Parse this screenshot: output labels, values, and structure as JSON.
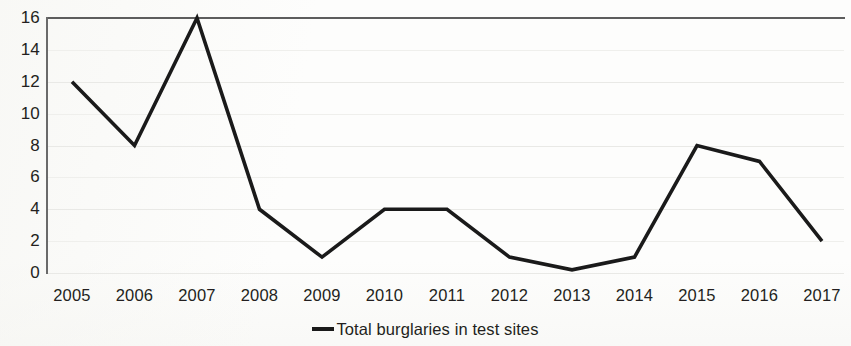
{
  "chart_data": {
    "type": "line",
    "title": "",
    "subtitle": "",
    "xlabel": "",
    "ylabel": "",
    "x": [
      "2005",
      "2006",
      "2007",
      "2008",
      "2009",
      "2010",
      "2011",
      "2012",
      "2013",
      "2014",
      "2015",
      "2016",
      "2017"
    ],
    "categories": [
      "2005",
      "2006",
      "2007",
      "2008",
      "2009",
      "2010",
      "2011",
      "2012",
      "2013",
      "2014",
      "2015",
      "2016",
      "2017"
    ],
    "series": [
      {
        "name": "Total burglaries in test sites",
        "values": [
          12,
          8,
          16,
          4,
          1,
          4,
          4,
          1,
          0.2,
          1,
          8,
          7,
          2
        ],
        "color": "#1a1a1a"
      }
    ],
    "ylim": [
      0,
      16
    ],
    "yticks": [
      0,
      2,
      4,
      6,
      8,
      10,
      12,
      14,
      16
    ],
    "ytick_labels": [
      "0",
      "2",
      "4",
      "6",
      "8",
      "10",
      "12",
      "14",
      "16"
    ],
    "grid": true,
    "grid_axis": "y",
    "legend": {
      "position": "bottom-center",
      "entries": [
        {
          "label": "Total burglaries in test sites",
          "marker": "line-marker",
          "color": "#1a1a1a"
        }
      ]
    },
    "colors": {
      "line": "#1a1a1a",
      "axis": "#5d5d5d",
      "grid": "#e9e9e6",
      "text": "#231f20",
      "background": "#fdfdfc"
    }
  }
}
